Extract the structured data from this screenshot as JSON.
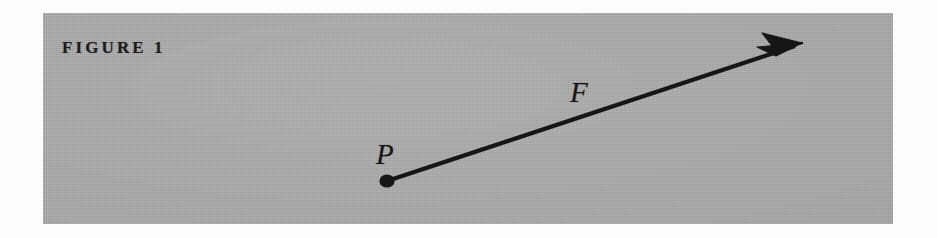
{
  "figure": {
    "caption": "FIGURE 1",
    "plate": {
      "background_color": "#a9a9a9",
      "page_color": "#fdfdfd",
      "ink_color": "#1c1c1c"
    },
    "labels": {
      "point_label": "P",
      "vector_label": "F"
    },
    "geometry": {
      "point_P": {
        "x": 387,
        "y": 181
      },
      "arrow_tip": {
        "x": 802,
        "y": 43
      },
      "arrow_line_width": 4,
      "point_dot_radius": 7
    }
  }
}
